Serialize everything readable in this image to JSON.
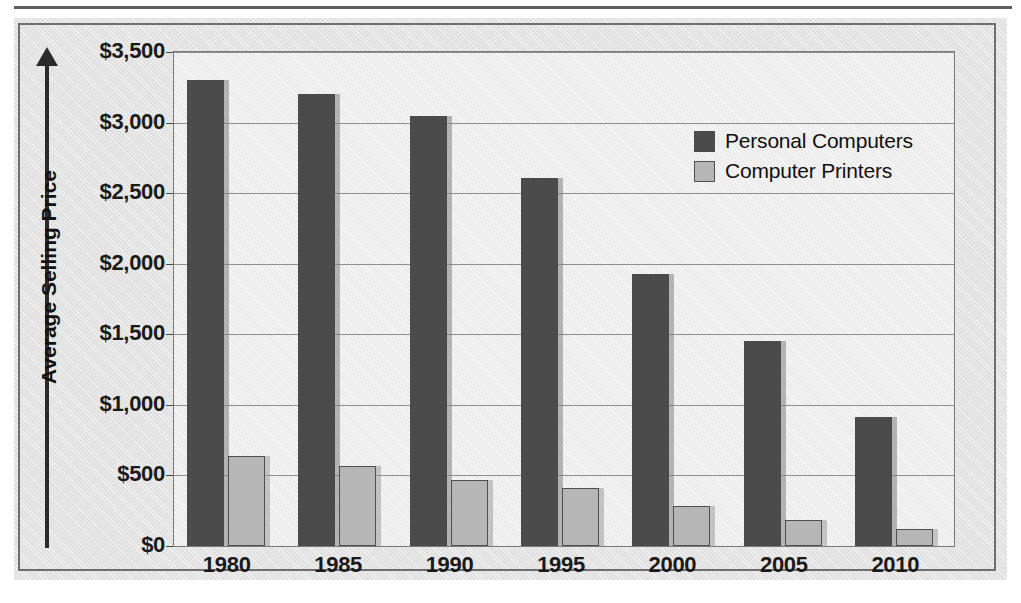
{
  "figure": {
    "panel_background": "#e3e3e3",
    "border_color": "#6f6f6f"
  },
  "chart_data": {
    "type": "bar",
    "title": "",
    "xlabel": "",
    "ylabel": "Average Selling Price",
    "categories": [
      "1980",
      "1985",
      "1990",
      "1995",
      "2000",
      "2005",
      "2010"
    ],
    "series": [
      {
        "name": "Personal Computers",
        "color": "#4b4b4b",
        "values": [
          3300,
          3200,
          3045,
          2610,
          1925,
          1450,
          915
        ]
      },
      {
        "name": "Computer Printers",
        "color": "#b6b6b6",
        "values": [
          635,
          570,
          465,
          410,
          285,
          185,
          120
        ]
      }
    ],
    "ylim": [
      0,
      3500
    ],
    "ytick_values": [
      0,
      500,
      1000,
      1500,
      2000,
      2500,
      3000,
      3500
    ],
    "ytick_labels": [
      "$0",
      "$500",
      "$1,000",
      "$1,500",
      "$2,000",
      "$2,500",
      "$3,000",
      "$3,500"
    ],
    "grid": true,
    "legend_position": "upper-right"
  },
  "legend": {
    "items": [
      {
        "label": "Personal Computers",
        "swatch": "dark"
      },
      {
        "label": "Computer Printers",
        "swatch": "light"
      }
    ]
  }
}
